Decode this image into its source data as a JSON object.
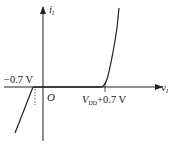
{
  "diagram": {
    "type": "transfer characteristic",
    "axes": {
      "x_label": "v",
      "x_label_sub": "I",
      "y_label": "i",
      "y_label_sub": "I",
      "origin_label": "O"
    },
    "annotations": {
      "neg_threshold": "−0.7 V",
      "pos_threshold_var": "V",
      "pos_threshold_sub": "DD",
      "pos_threshold_rest": "+0.7 V"
    },
    "colors": {
      "stroke": "#222222",
      "background": "#ffffff"
    }
  }
}
